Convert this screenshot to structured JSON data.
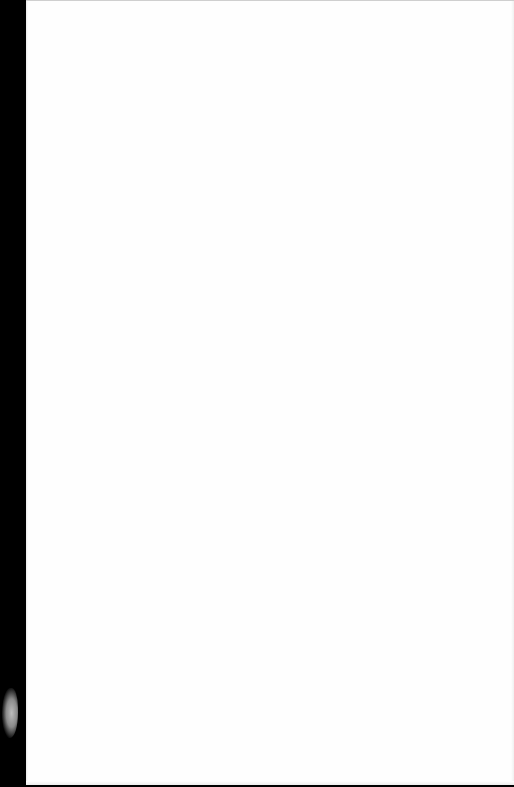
{
  "document": {
    "type": "scanned-page",
    "content": "",
    "page_color": "#fefefe",
    "margin_color": "#000000"
  }
}
